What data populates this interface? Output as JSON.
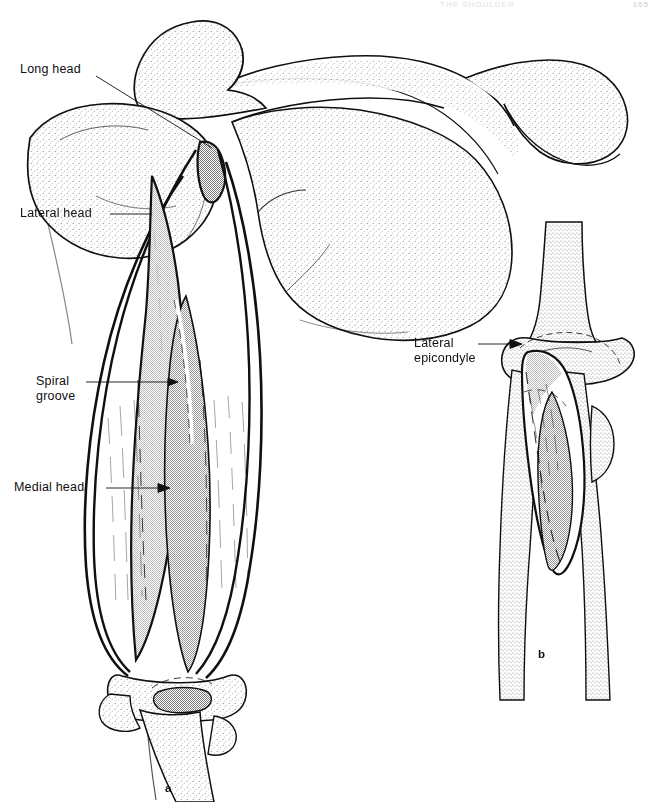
{
  "page": {
    "running_head": "THE SHOULDER",
    "page_number": "105",
    "background_color": "#ffffff",
    "ink_color": "#101010"
  },
  "figure": {
    "panels": [
      {
        "id": "a",
        "caption": "a",
        "description": "posterior view of scapula, humerus and triceps brachii heads"
      },
      {
        "id": "b",
        "caption": "b",
        "description": "posterior view of elbow showing anconeus and lateral epicondyle"
      }
    ],
    "labels": [
      {
        "name": "long-head",
        "text": "Long head",
        "lines": [
          "Long head"
        ]
      },
      {
        "name": "lateral-head",
        "text": "Lateral head",
        "lines": [
          "Lateral head"
        ]
      },
      {
        "name": "spiral-groove",
        "text": "Spiral groove",
        "lines": [
          "Spiral",
          "groove"
        ]
      },
      {
        "name": "medial-head",
        "text": "Medial head",
        "lines": [
          "Medial head"
        ]
      },
      {
        "name": "lateral-epicondyle",
        "text": "Lateral epicondyle",
        "lines": [
          "Lateral",
          "epicondyle"
        ]
      }
    ],
    "shading": {
      "bone_stipple": "#d2d2d2",
      "muscle_light": "#dcdcdc",
      "muscle_dark": "#b4b4b4",
      "outline": "#101010"
    }
  }
}
